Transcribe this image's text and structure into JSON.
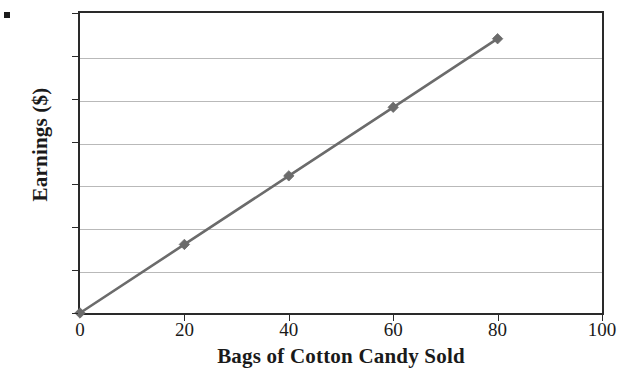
{
  "chart_data": {
    "type": "line",
    "title": "",
    "subtitle": "",
    "xlabel": "Bags of Cotton Candy Sold",
    "ylabel": "Earnings ($)",
    "x": [
      0,
      20,
      40,
      60,
      80
    ],
    "values": [
      0,
      8,
      16,
      24,
      32
    ],
    "series": [
      {
        "name": "Earnings",
        "x": [
          0,
          20,
          40,
          60,
          80
        ],
        "values": [
          0,
          8,
          16,
          24,
          32
        ],
        "color": "#6b6b6b",
        "marker": "diamond",
        "line_width": 2.4
      }
    ],
    "xlim": [
      0,
      100
    ],
    "ylim": [
      0,
      35
    ],
    "xticks": [
      0,
      20,
      40,
      60,
      80,
      100
    ],
    "yticks": [
      0,
      5,
      10,
      15,
      20,
      25,
      30,
      35
    ],
    "xtick_labels": [
      "0",
      "20",
      "40",
      "60",
      "80",
      "100"
    ],
    "ytick_labels": [
      "0",
      "5",
      "10",
      "15",
      "20",
      "25",
      "30",
      "35"
    ],
    "grid": "horizontal",
    "grid_color": "#b9b9b9",
    "legend": "none",
    "legend_position": "none",
    "annotations": [],
    "axis_color": "#2a2a2a",
    "background": "#ffffff",
    "slope": 0.4
  },
  "figure": {
    "artifact_name": "scan-dot"
  }
}
